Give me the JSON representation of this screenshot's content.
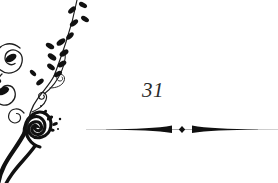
{
  "page": {
    "background_color": "#ffffff",
    "width": 278,
    "height": 183
  },
  "ornament": {
    "name": "floral-vine-flourish",
    "position": "left-edge",
    "color": "#111111",
    "description": "Black calligraphic vine with leaves, scrolls and spirals running down the left side and off the bottom edge",
    "accent_color": "#3a3a3a"
  },
  "page_number": {
    "value": "31",
    "style": "italic-serif",
    "color": "#2b2b2b"
  },
  "divider": {
    "name": "tapered-rule-with-center-diamond",
    "color": "#101010",
    "tail_color": "#9a9a9a",
    "center_ornament": "diamond-dot"
  }
}
